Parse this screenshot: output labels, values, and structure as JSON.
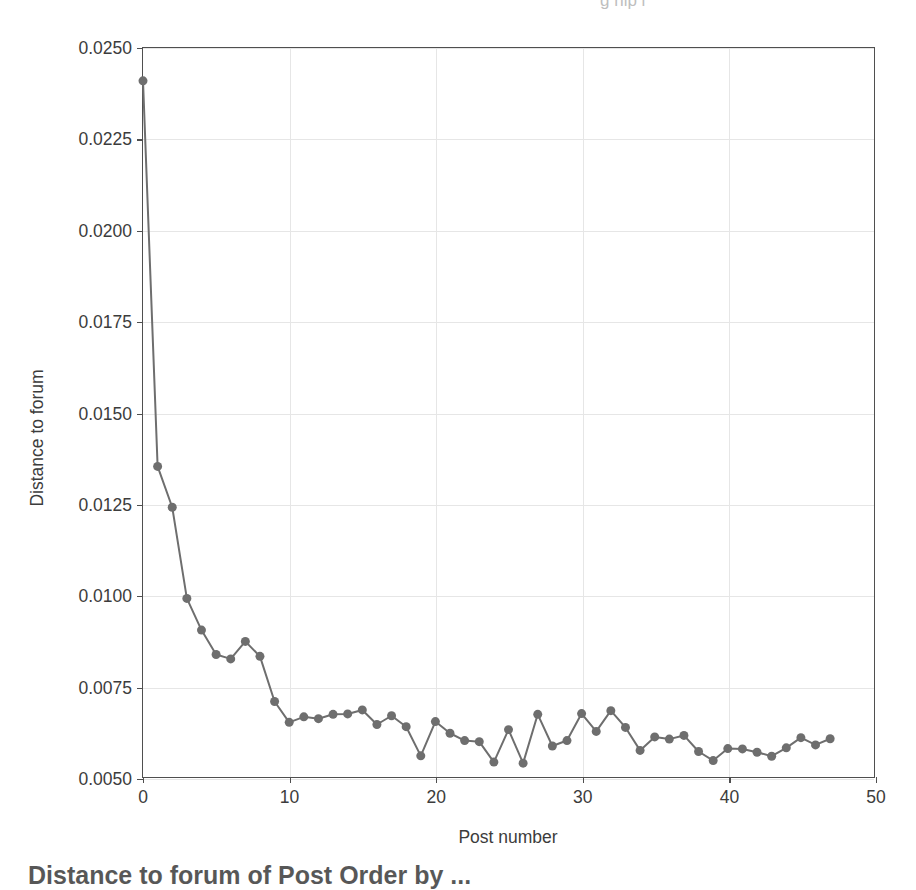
{
  "figure": {
    "top_clipped_text": "g   hip  i",
    "bottom_clipped_text": "Distance to forum of Post Order by ...",
    "background_color": "#ffffff",
    "axes_color": "#4f4f4f",
    "grid_color": "#e6e6e6"
  },
  "chart_data": {
    "type": "line",
    "title": "",
    "xlabel": "Post number",
    "ylabel": "Distance to forum",
    "xlim": [
      0,
      50
    ],
    "ylim": [
      0.005,
      0.025
    ],
    "xticks": [
      0,
      10,
      20,
      30,
      40,
      50
    ],
    "xtick_labels": [
      "0",
      "10",
      "20",
      "30",
      "40",
      "50"
    ],
    "yticks": [
      0.005,
      0.0075,
      0.01,
      0.0125,
      0.015,
      0.0175,
      0.02,
      0.0225,
      0.025
    ],
    "ytick_labels": [
      "0.0050",
      "0.0075",
      "0.0100",
      "0.0125",
      "0.0150",
      "0.0175",
      "0.0200",
      "0.0225",
      "0.0250"
    ],
    "grid": true,
    "legend": null,
    "marker": "circle",
    "marker_size": 9,
    "line_width": 2,
    "series_color": "#6e6e6e",
    "x": [
      0,
      1,
      2,
      3,
      4,
      5,
      6,
      7,
      8,
      9,
      10,
      11,
      12,
      13,
      14,
      15,
      16,
      17,
      18,
      19,
      20,
      21,
      22,
      23,
      24,
      25,
      26,
      27,
      28,
      29,
      30,
      31,
      32,
      33,
      34,
      35,
      36,
      37,
      38,
      39,
      40,
      41,
      42,
      43,
      44,
      45,
      46,
      47
    ],
    "values": [
      0.0241,
      0.01352,
      0.0124,
      0.0099,
      0.00903,
      0.00836,
      0.00824,
      0.00872,
      0.00831,
      0.00707,
      0.0065,
      0.00665,
      0.0066,
      0.00672,
      0.00673,
      0.00684,
      0.00644,
      0.00668,
      0.00638,
      0.00558,
      0.00652,
      0.0062,
      0.006,
      0.00597,
      0.00541,
      0.0063,
      0.00538,
      0.00672,
      0.00585,
      0.006,
      0.00674,
      0.00625,
      0.00682,
      0.00636,
      0.00573,
      0.0061,
      0.00604,
      0.00614,
      0.0057,
      0.00545,
      0.00578,
      0.00577,
      0.00568,
      0.00557,
      0.0058,
      0.00608,
      0.00588,
      0.00605
    ]
  }
}
